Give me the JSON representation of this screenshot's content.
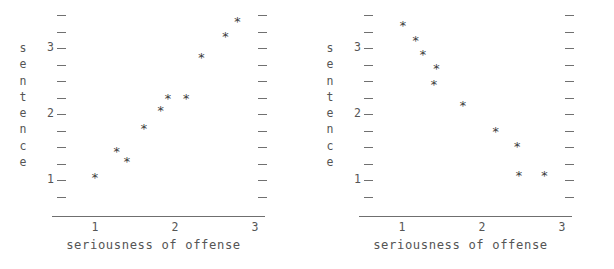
{
  "figure": {
    "background": "#ffffff",
    "axis_color": "#6f6f6f",
    "tick_color": "#707070",
    "marker_color": "#3d3d3d",
    "marker_glyph": "*"
  },
  "panels": [
    {
      "id": "left",
      "ytitle_chars": [
        "s",
        "e",
        "n",
        "t",
        "e",
        "n",
        "c",
        "e"
      ],
      "ytitle_text": "sentence",
      "xtitle": "seriousness of offense",
      "xticklabels": [
        "1",
        "2",
        "3"
      ],
      "yticklabels": [
        "3",
        "2",
        "1"
      ]
    },
    {
      "id": "right",
      "ytitle_chars": [
        "s",
        "e",
        "n",
        "t",
        "e",
        "n",
        "c",
        "e"
      ],
      "ytitle_text": "sentence",
      "xtitle": "seriousness of offense",
      "xticklabels": [
        "1",
        "2",
        "3"
      ],
      "yticklabels": [
        "3",
        "2",
        "1"
      ]
    }
  ],
  "chart_data": [
    {
      "type": "scatter",
      "title": "",
      "xlabel": "seriousness of offense",
      "ylabel": "sentence",
      "xlim": [
        0.72,
        3.32
      ],
      "ylim": [
        0.58,
        3.62
      ],
      "xticks": [
        1,
        2,
        3
      ],
      "yticks": [
        1,
        2,
        3
      ],
      "grid": false,
      "legend": false,
      "marker": "*",
      "relationship": "positive",
      "points": [
        {
          "x": 1.0,
          "y": 1.03
        },
        {
          "x": 1.27,
          "y": 1.42
        },
        {
          "x": 1.4,
          "y": 1.27
        },
        {
          "x": 1.61,
          "y": 1.78
        },
        {
          "x": 1.82,
          "y": 2.04
        },
        {
          "x": 1.91,
          "y": 2.22
        },
        {
          "x": 2.14,
          "y": 2.22
        },
        {
          "x": 2.33,
          "y": 2.85
        },
        {
          "x": 2.63,
          "y": 3.16
        },
        {
          "x": 2.78,
          "y": 3.4
        }
      ]
    },
    {
      "type": "scatter",
      "title": "",
      "xlabel": "seriousness of offense",
      "ylabel": "sentence",
      "xlim": [
        0.72,
        3.32
      ],
      "ylim": [
        0.58,
        3.62
      ],
      "xticks": [
        1,
        2,
        3
      ],
      "yticks": [
        1,
        2,
        3
      ],
      "grid": false,
      "legend": false,
      "marker": "*",
      "relationship": "negative",
      "points": [
        {
          "x": 1.01,
          "y": 3.33
        },
        {
          "x": 1.17,
          "y": 3.11
        },
        {
          "x": 1.26,
          "y": 2.89
        },
        {
          "x": 1.43,
          "y": 2.68
        },
        {
          "x": 1.4,
          "y": 2.44
        },
        {
          "x": 1.76,
          "y": 2.12
        },
        {
          "x": 2.17,
          "y": 1.73
        },
        {
          "x": 2.44,
          "y": 1.5
        },
        {
          "x": 2.46,
          "y": 1.06
        },
        {
          "x": 2.78,
          "y": 1.06
        }
      ]
    }
  ]
}
